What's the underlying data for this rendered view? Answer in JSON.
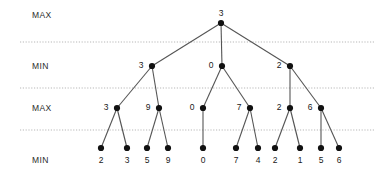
{
  "diagram": {
    "colors": {
      "node": "#111111",
      "edge": "#555555",
      "separator": "#9a9a9a",
      "text": "#1a1a1a",
      "background": "#ffffff"
    },
    "row_labels": [
      {
        "name": "level-0-label",
        "text": "MAX",
        "x": 32,
        "y": 15
      },
      {
        "name": "level-1-label",
        "text": "MIN",
        "x": 32,
        "y": 66
      },
      {
        "name": "level-2-label",
        "text": "MAX",
        "x": 32,
        "y": 108
      },
      {
        "name": "level-3-label",
        "text": "MIN",
        "x": 32,
        "y": 160
      }
    ],
    "separators": [
      {
        "name": "separator-max-min",
        "y": 42,
        "x1": 20,
        "x2": 374
      },
      {
        "name": "separator-min-max",
        "y": 88,
        "x1": 20,
        "x2": 374
      },
      {
        "name": "separator-max-min-2",
        "y": 130,
        "x1": 20,
        "x2": 374
      }
    ],
    "nodes": [
      {
        "id": "root",
        "level": 0,
        "x": 221,
        "y": 23,
        "value": "3",
        "label_pos": "above"
      },
      {
        "id": "m1",
        "level": 1,
        "x": 152,
        "y": 66,
        "value": "3",
        "label_pos": "left"
      },
      {
        "id": "m2",
        "level": 1,
        "x": 222,
        "y": 66,
        "value": "0",
        "label_pos": "left"
      },
      {
        "id": "m3",
        "level": 1,
        "x": 290,
        "y": 66,
        "value": "2",
        "label_pos": "left"
      },
      {
        "id": "x1",
        "level": 2,
        "x": 117,
        "y": 108,
        "value": "3",
        "label_pos": "left"
      },
      {
        "id": "x2",
        "level": 2,
        "x": 159,
        "y": 108,
        "value": "9",
        "label_pos": "left"
      },
      {
        "id": "x3",
        "level": 2,
        "x": 203,
        "y": 108,
        "value": "0",
        "label_pos": "left"
      },
      {
        "id": "x4",
        "level": 2,
        "x": 250,
        "y": 108,
        "value": "7",
        "label_pos": "left"
      },
      {
        "id": "x5",
        "level": 2,
        "x": 290,
        "y": 108,
        "value": "2",
        "label_pos": "left"
      },
      {
        "id": "x6",
        "level": 2,
        "x": 321,
        "y": 108,
        "value": "6",
        "label_pos": "left"
      },
      {
        "id": "l1",
        "level": 3,
        "x": 101,
        "y": 148,
        "value": "2",
        "label_pos": "below"
      },
      {
        "id": "l2",
        "level": 3,
        "x": 127,
        "y": 148,
        "value": "3",
        "label_pos": "below"
      },
      {
        "id": "l3",
        "level": 3,
        "x": 147,
        "y": 148,
        "value": "5",
        "label_pos": "below"
      },
      {
        "id": "l4",
        "level": 3,
        "x": 168,
        "y": 148,
        "value": "9",
        "label_pos": "below"
      },
      {
        "id": "l5",
        "level": 3,
        "x": 203,
        "y": 148,
        "value": "0",
        "label_pos": "below"
      },
      {
        "id": "l6",
        "level": 3,
        "x": 236,
        "y": 148,
        "value": "7",
        "label_pos": "below"
      },
      {
        "id": "l7",
        "level": 3,
        "x": 258,
        "y": 148,
        "value": "4",
        "label_pos": "below"
      },
      {
        "id": "l8",
        "level": 3,
        "x": 275,
        "y": 148,
        "value": "2",
        "label_pos": "below"
      },
      {
        "id": "l9",
        "level": 3,
        "x": 300,
        "y": 148,
        "value": "1",
        "label_pos": "below"
      },
      {
        "id": "l10",
        "level": 3,
        "x": 321,
        "y": 148,
        "value": "5",
        "label_pos": "below"
      },
      {
        "id": "l11",
        "level": 3,
        "x": 339,
        "y": 148,
        "value": "6",
        "label_pos": "below"
      }
    ],
    "edges": [
      {
        "from": "root",
        "to": "m1"
      },
      {
        "from": "root",
        "to": "m2"
      },
      {
        "from": "root",
        "to": "m3"
      },
      {
        "from": "m1",
        "to": "x1"
      },
      {
        "from": "m1",
        "to": "x2"
      },
      {
        "from": "m2",
        "to": "x3"
      },
      {
        "from": "m2",
        "to": "x4"
      },
      {
        "from": "m3",
        "to": "x5"
      },
      {
        "from": "m3",
        "to": "x6"
      },
      {
        "from": "x1",
        "to": "l1"
      },
      {
        "from": "x1",
        "to": "l2"
      },
      {
        "from": "x2",
        "to": "l3"
      },
      {
        "from": "x2",
        "to": "l4"
      },
      {
        "from": "x3",
        "to": "l5"
      },
      {
        "from": "x4",
        "to": "l6"
      },
      {
        "from": "x4",
        "to": "l7"
      },
      {
        "from": "x5",
        "to": "l8"
      },
      {
        "from": "x5",
        "to": "l9"
      },
      {
        "from": "x6",
        "to": "l10"
      },
      {
        "from": "x6",
        "to": "l11"
      }
    ]
  }
}
